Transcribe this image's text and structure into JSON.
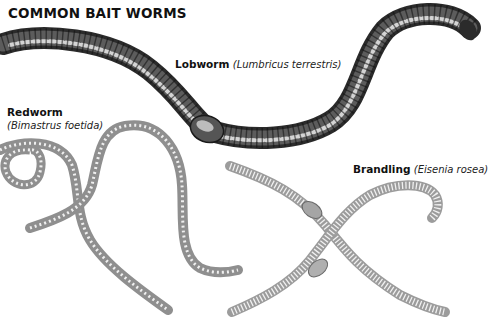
{
  "title": "COMMON BAIT WORMS",
  "worms": [
    {
      "id": "lobworm",
      "common_name": "Lobworm",
      "scientific_name": "(Lumbricus terrestris)",
      "shading": "dark"
    },
    {
      "id": "redworm",
      "common_name": "Redworm",
      "scientific_name": "(Bimastrus foetida)",
      "shading": "light-grey"
    },
    {
      "id": "brandling",
      "common_name": "Brandling",
      "scientific_name": "(Eisenia rosea)",
      "shading": "light-grey"
    }
  ],
  "colors": {
    "background": "#ffffff",
    "lobworm_body": "#3a3a3a",
    "lobworm_highlight": "#d8d8d8",
    "light_worm_body": "#9a9a9a",
    "light_worm_segment": "#f2f2f2",
    "text": "#111111"
  }
}
